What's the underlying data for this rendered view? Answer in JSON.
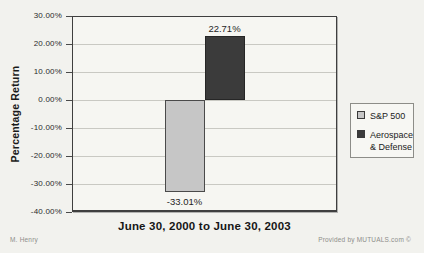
{
  "page": {
    "background": "#f2f2ee"
  },
  "chart_data": {
    "type": "bar",
    "categories": [
      "June 30, 2000 to June 30, 2003"
    ],
    "series": [
      {
        "name": "S&P 500",
        "legend_label": "S&P 500",
        "values": [
          -33.01
        ],
        "color": "#c6c6c6",
        "border_color": "#4a4a4a"
      },
      {
        "name": "Aerospace & Defense",
        "legend_label": "Aerospace\n& Defense",
        "values": [
          22.71
        ],
        "color": "#3b3b3b",
        "border_color": "#262626"
      }
    ],
    "title": "",
    "xlabel": "June 30, 2000 to June 30, 2003",
    "ylabel": "Percentage Return",
    "ylim": [
      -40,
      30
    ],
    "ytick_step": 10,
    "ytick_format": "percent_2dp",
    "data_labels": [
      "-33.01%",
      "22.71%"
    ],
    "grid": "horizontal",
    "legend_position": "right"
  },
  "labels": {
    "y_axis_title": "Percentage Return",
    "x_axis_title": "June 30, 2000 to June 30, 2003"
  },
  "credits": {
    "author": "M. Henry",
    "provider": "Provided by MUTUALS.com ©"
  }
}
